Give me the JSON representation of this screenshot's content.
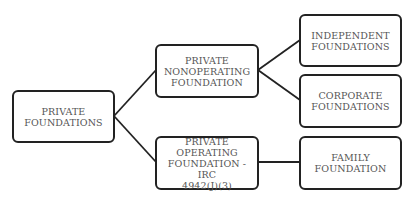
{
  "diagram": {
    "type": "hierarchy-tree",
    "colors": {
      "border": "#222222",
      "text": "#555555",
      "background": "#ffffff",
      "connector": "#222222"
    },
    "nodes": {
      "root": {
        "label": "PRIVATE\nFOUNDATIONS"
      },
      "nonoperating": {
        "label": "PRIVATE\nNONOPERATING\nFOUNDATION"
      },
      "operating": {
        "label": "PRIVATE\nOPERATING\nFOUNDATION - IRC\n4942(J)(3)"
      },
      "independent": {
        "label": "INDEPENDENT\nFOUNDATIONS"
      },
      "corporate": {
        "label": "CORPORATE\nFOUNDATIONS"
      },
      "family": {
        "label": "FAMILY\nFOUNDATION"
      }
    },
    "edges": [
      {
        "from": "root",
        "to": "nonoperating"
      },
      {
        "from": "root",
        "to": "operating"
      },
      {
        "from": "nonoperating",
        "to": "independent"
      },
      {
        "from": "nonoperating",
        "to": "corporate"
      },
      {
        "from": "operating",
        "to": "family"
      }
    ]
  }
}
